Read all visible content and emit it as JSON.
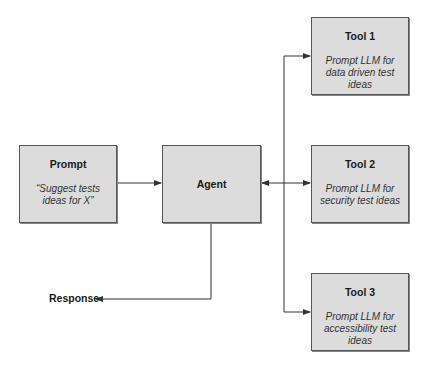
{
  "nodes": {
    "prompt": {
      "title": "Prompt",
      "desc": "“Suggest tests ideas for X”"
    },
    "agent": {
      "title": "Agent"
    },
    "tool1": {
      "title": "Tool 1",
      "desc": "Prompt LLM for data driven test ideas"
    },
    "tool2": {
      "title": "Tool 2",
      "desc": "Prompt LLM for security test ideas"
    },
    "tool3": {
      "title": "Tool 3",
      "desc": "Prompt LLM for accessibility test ideas"
    }
  },
  "output": {
    "label": "Response"
  },
  "edges": [
    {
      "from": "Prompt",
      "to": "Agent",
      "type": "arrow"
    },
    {
      "from": "Agent",
      "to": "Tools",
      "type": "bidirectional"
    },
    {
      "from": "Bus",
      "to": "Tool 1",
      "type": "arrow"
    },
    {
      "from": "Bus",
      "to": "Tool 2",
      "type": "arrow"
    },
    {
      "from": "Bus",
      "to": "Tool 3",
      "type": "arrow"
    },
    {
      "from": "Agent",
      "to": "Response",
      "type": "arrow"
    }
  ],
  "colors": {
    "box_fill": "#dcdcdc",
    "box_border": "#555555",
    "line": "#333333"
  }
}
